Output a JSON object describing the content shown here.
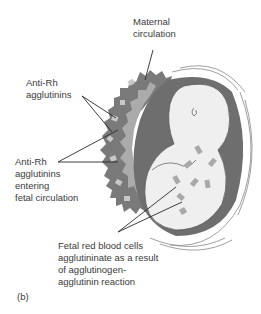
{
  "labels": {
    "maternal": [
      "Maternal",
      "circulation"
    ],
    "anti_rh": [
      "Anti-Rh",
      "agglutinins"
    ],
    "anti_rh_entering": [
      "Anti-Rh",
      "agglutinins",
      "entering",
      "fetal circulation"
    ],
    "fetal_rbc": [
      "Fetal red blood cells",
      "agglutininate as a result",
      "of agglutinogen-",
      "agglutinin reaction"
    ]
  },
  "panel_label": "(b)",
  "colors": {
    "maternal_tissue": "#7a7a7a",
    "placenta": "#a8a8a8",
    "uterine_wall": "#6e6e6e",
    "fetus": "#efefef",
    "cells": "#9e9e9e",
    "leader": "#2a2a2a"
  }
}
